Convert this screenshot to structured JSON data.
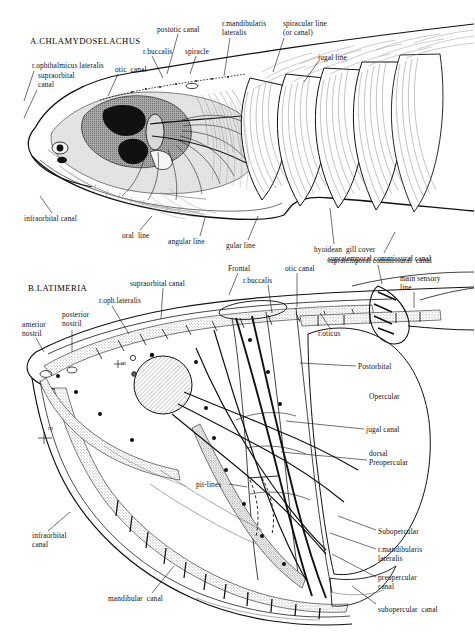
{
  "figure": {
    "title_a": "A.CHLAMYDOSELACHUS",
    "title_b": "B.LATIMERIA"
  },
  "panel_a": {
    "name": "chlamydoselachus-head-lateral-view",
    "labels": [
      {
        "id": "a-ophthalmicus",
        "text": "r.ophthalmicus lateralis",
        "x": 32,
        "y": 62,
        "lead": [
          [
            34,
            71
          ],
          [
            24,
            101
          ]
        ]
      },
      {
        "id": "a-supraorbital",
        "text": "supraorbital\ncanal",
        "x": 38,
        "y": 72,
        "lead": [
          [
            37,
            90
          ],
          [
            24,
            118
          ]
        ]
      },
      {
        "id": "a-otic",
        "text": "otic  canal",
        "x": 115,
        "y": 66,
        "lead": [
          [
            118,
            74
          ],
          [
            108,
            96
          ]
        ]
      },
      {
        "id": "a-buccalis",
        "text": "r.buccalis",
        "x": 143,
        "y": 48,
        "lead": [
          [
            152,
            56
          ],
          [
            163,
            78
          ]
        ]
      },
      {
        "id": "a-postotic",
        "text": "postotic canal",
        "x": 157,
        "y": 26,
        "lead": [
          [
            178,
            34
          ],
          [
            167,
            74
          ]
        ]
      },
      {
        "id": "a-spiracle",
        "text": "spiracle",
        "x": 185,
        "y": 48,
        "lead": [
          [
            196,
            56
          ],
          [
            190,
            74
          ]
        ]
      },
      {
        "id": "a-mandibularis",
        "text": "r.mandibularis\nlateralis",
        "x": 222,
        "y": 20,
        "lead": [
          [
            230,
            38
          ],
          [
            224,
            76
          ]
        ]
      },
      {
        "id": "a-spiracular",
        "text": "spiracular line\n(or canal)",
        "x": 283,
        "y": 20,
        "lead": [
          [
            284,
            38
          ],
          [
            273,
            72
          ]
        ]
      },
      {
        "id": "a-jugal",
        "text": "jugal line",
        "x": 318,
        "y": 54,
        "lead": [
          [
            318,
            62
          ],
          [
            304,
            82
          ]
        ]
      },
      {
        "id": "a-infraorbital",
        "text": "infraorbital canal",
        "x": 24,
        "y": 215,
        "lead": [
          [
            52,
            213
          ],
          [
            40,
            196
          ]
        ]
      },
      {
        "id": "a-oral",
        "text": "oral  line",
        "x": 122,
        "y": 232,
        "lead": [
          [
            140,
            230
          ],
          [
            152,
            216
          ]
        ]
      },
      {
        "id": "a-angular",
        "text": "angular line",
        "x": 168,
        "y": 238,
        "lead": [
          [
            200,
            236
          ],
          [
            205,
            218
          ]
        ]
      },
      {
        "id": "a-gular",
        "text": "gular line",
        "x": 226,
        "y": 242,
        "lead": [
          [
            248,
            240
          ],
          [
            258,
            216
          ]
        ]
      },
      {
        "id": "a-hyoidean",
        "text": "hyoidean  gill cover",
        "x": 314,
        "y": 246,
        "lead": [
          [
            334,
            244
          ],
          [
            330,
            208
          ]
        ]
      },
      {
        "id": "a-supratemporal",
        "text": "supratemporal commissural canal",
        "x": 328,
        "y": 255,
        "lead": [
          [
            384,
            253
          ],
          [
            395,
            232
          ]
        ]
      }
    ]
  },
  "panel_b": {
    "name": "latimeria-head-lateral-view",
    "labels": [
      {
        "id": "b-anterior-nostril",
        "text": "anterior\nnostril",
        "x": 22,
        "y": 321,
        "lead": [
          [
            36,
            338
          ],
          [
            44,
            352
          ]
        ]
      },
      {
        "id": "b-posterior-nostril",
        "text": "posterior\nnostril",
        "x": 62,
        "y": 311,
        "lead": [
          [
            72,
            330
          ],
          [
            72,
            352
          ]
        ]
      },
      {
        "id": "b-oph-lateralis",
        "text": "r.oph.lateralis",
        "x": 99,
        "y": 297,
        "lead": [
          [
            112,
            306
          ],
          [
            129,
            334
          ]
        ]
      },
      {
        "id": "b-supraorbital",
        "text": "supraorbital canal",
        "x": 130,
        "y": 280,
        "lead": [
          [
            163,
            288
          ],
          [
            161,
            319
          ]
        ]
      },
      {
        "id": "b-frontal",
        "text": "Frontal",
        "x": 228,
        "y": 265,
        "lead": [
          [
            238,
            273
          ],
          [
            229,
            295
          ]
        ]
      },
      {
        "id": "b-buccalis",
        "text": "r.buccalis",
        "x": 243,
        "y": 277,
        "lead": [
          [
            268,
            285
          ],
          [
            272,
            313
          ]
        ]
      },
      {
        "id": "b-otic",
        "text": "otic canal",
        "x": 285,
        "y": 265,
        "lead": [
          [
            297,
            273
          ],
          [
            297,
            307
          ]
        ]
      },
      {
        "id": "b-supratemporal",
        "text": "supratemporal commissural  canal",
        "x": 327,
        "y": 257,
        "lead": [
          [
            378,
            265
          ],
          [
            382,
            284
          ]
        ]
      },
      {
        "id": "b-main-sensory",
        "text": "main sensory\nline",
        "x": 400,
        "y": 275,
        "lead": [
          [
            414,
            292
          ],
          [
            414,
            308
          ]
        ]
      },
      {
        "id": "b-oticus",
        "text": "r.oticus",
        "x": 318,
        "y": 330,
        "lead": [
          [
            330,
            328
          ],
          [
            320,
            313
          ]
        ]
      },
      {
        "id": "b-postorbital",
        "text": "Postorbital",
        "x": 358,
        "y": 363,
        "lead": [
          [
            356,
            366
          ],
          [
            300,
            363
          ]
        ]
      },
      {
        "id": "b-opercular",
        "text": "Opercular",
        "x": 369,
        "y": 393,
        "lead": null
      },
      {
        "id": "b-jugal-canal",
        "text": "jugal canal",
        "x": 366,
        "y": 426,
        "lead": [
          [
            364,
            429
          ],
          [
            286,
            421
          ]
        ]
      },
      {
        "id": "b-dorsal-preopercular",
        "text": "dorsal\nPreopercular",
        "x": 369,
        "y": 450,
        "lead": [
          [
            367,
            460
          ],
          [
            281,
            452
          ]
        ]
      },
      {
        "id": "b-pit-lines",
        "text": "pit-lines",
        "x": 196,
        "y": 481,
        "lead": [
          [
            229,
            484
          ],
          [
            247,
            487
          ]
        ]
      },
      {
        "id": "b-subopercular",
        "text": "Subopercular",
        "x": 378,
        "y": 528,
        "lead": [
          [
            376,
            530
          ],
          [
            338,
            516
          ]
        ]
      },
      {
        "id": "b-mandibularis",
        "text": "r.mandibularis\nlateralis",
        "x": 378,
        "y": 546,
        "lead": [
          [
            376,
            549
          ],
          [
            330,
            533
          ]
        ]
      },
      {
        "id": "b-preopercular",
        "text": "preopercular\ncanal",
        "x": 378,
        "y": 574,
        "lead": [
          [
            376,
            577
          ],
          [
            332,
            554
          ]
        ]
      },
      {
        "id": "b-subopercular-canal",
        "text": "subopercular  canal",
        "x": 378,
        "y": 606,
        "lead": [
          [
            376,
            604
          ],
          [
            352,
            586
          ]
        ]
      },
      {
        "id": "b-infraorbital",
        "text": "infraorbital\ncanal",
        "x": 32,
        "y": 532,
        "lead": [
          [
            48,
            531
          ],
          [
            70,
            512
          ]
        ]
      },
      {
        "id": "b-mandibular",
        "text": "mandibular  canal",
        "x": 108,
        "y": 595,
        "lead": [
          [
            152,
            593
          ],
          [
            174,
            566
          ]
        ]
      }
    ],
    "rostral_organ_marks": [
      {
        "id": "ro-1",
        "text": "ro",
        "x": 121,
        "y": 359
      },
      {
        "id": "ro-2",
        "text": "ro",
        "x": 48,
        "y": 424
      }
    ]
  },
  "colors": {
    "ink": "#111111",
    "line": "#1a1a1a",
    "stipple": "#8d8d8d",
    "wash": "#cfcfcf",
    "hatch": "#777777"
  }
}
